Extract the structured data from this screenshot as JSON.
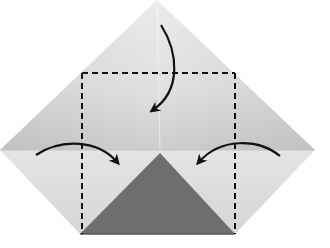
{
  "diagram": {
    "type": "origami-fold-instruction",
    "colors": {
      "background": "#ffffff",
      "paper_upper_light": "#e2e2e2",
      "paper_upper_dark": "#cfcfcf",
      "paper_lower": "#dadada",
      "flap_dark": "#6e6e6e",
      "line": "#111111"
    },
    "paper_outline": {
      "top": [
        157,
        0
      ],
      "left": [
        0,
        150
      ],
      "right": [
        315,
        150
      ],
      "bottom_left": [
        80,
        234
      ],
      "bottom_right": [
        235,
        234
      ]
    },
    "crease_y": 150,
    "dashed_fold_box": {
      "x1": 82,
      "y1": 73,
      "x2": 235,
      "y2": 234
    },
    "dark_flap_triangle": {
      "apex": [
        160,
        153
      ],
      "base_left": [
        80,
        234
      ],
      "base_right": [
        235,
        234
      ]
    },
    "arrows": [
      {
        "name": "top-fold-arrow",
        "direction": "down"
      },
      {
        "name": "left-fold-arrow",
        "direction": "right"
      },
      {
        "name": "right-fold-arrow",
        "direction": "left"
      }
    ]
  }
}
